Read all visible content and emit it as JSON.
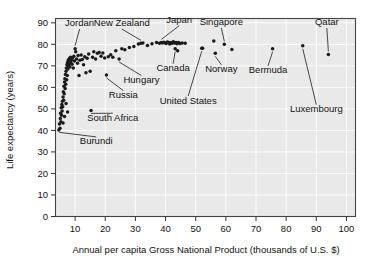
{
  "chart_data": {
    "type": "scatter",
    "title": "",
    "xlabel": "Annual per capita Gross National Product (thousands of U.S. $)",
    "ylabel": "Life expectancy (years)",
    "xlim": [
      3.5,
      103
    ],
    "ylim": [
      0,
      92
    ],
    "xticks": [
      10,
      20,
      30,
      40,
      50,
      60,
      70,
      80,
      90,
      100
    ],
    "xtick_labels": [
      "10",
      "20",
      "30",
      "40",
      "50",
      "60",
      "70",
      "80",
      "90",
      "100"
    ],
    "yticks": [
      0,
      10,
      20,
      30,
      40,
      50,
      60,
      70,
      80,
      90
    ],
    "ytick_labels": [
      "0",
      "10",
      "20",
      "30",
      "40",
      "50",
      "60",
      "70",
      "80",
      "90"
    ],
    "grid": true,
    "legend": "none",
    "marker": "filled-circle",
    "marker_color": "#1a1a1a",
    "plot_background": "#e9e9e9",
    "points": [
      [
        4.6,
        40.2
      ],
      [
        4.8,
        43.0
      ],
      [
        5.0,
        41.0
      ],
      [
        5.1,
        45.5
      ],
      [
        5.2,
        48.0
      ],
      [
        5.3,
        44.0
      ],
      [
        5.4,
        50.5
      ],
      [
        5.5,
        47.0
      ],
      [
        5.6,
        52.0
      ],
      [
        5.7,
        49.0
      ],
      [
        5.8,
        53.5
      ],
      [
        5.9,
        51.0
      ],
      [
        6.0,
        55.5
      ],
      [
        6.0,
        43.5
      ],
      [
        6.1,
        58.0
      ],
      [
        6.2,
        54.0
      ],
      [
        6.3,
        60.5
      ],
      [
        6.4,
        57.0
      ],
      [
        6.5,
        62.5
      ],
      [
        6.5,
        46.5
      ],
      [
        6.6,
        64.0
      ],
      [
        6.7,
        59.5
      ],
      [
        6.8,
        66.0
      ],
      [
        6.9,
        61.5
      ],
      [
        7.0,
        67.5
      ],
      [
        7.0,
        52.5
      ],
      [
        7.1,
        69.0
      ],
      [
        7.2,
        63.5
      ],
      [
        7.3,
        70.5
      ],
      [
        7.4,
        65.5
      ],
      [
        7.5,
        71.5
      ],
      [
        7.5,
        48.5
      ],
      [
        7.6,
        68.5
      ],
      [
        7.7,
        72.5
      ],
      [
        7.8,
        70.0
      ],
      [
        7.9,
        73.0
      ],
      [
        8.0,
        71.0
      ],
      [
        8.1,
        72.0
      ],
      [
        8.2,
        73.5
      ],
      [
        8.3,
        69.5
      ],
      [
        8.5,
        74.0
      ],
      [
        8.6,
        71.8
      ],
      [
        8.8,
        72.8
      ],
      [
        9.0,
        70.8
      ],
      [
        9.2,
        73.8
      ],
      [
        9.4,
        69.0
      ],
      [
        9.6,
        74.5
      ],
      [
        9.8,
        72.2
      ],
      [
        10.0,
        78.0
      ],
      [
        10.2,
        76.5
      ],
      [
        10.5,
        73.2
      ],
      [
        10.8,
        71.2
      ],
      [
        11.0,
        74.8
      ],
      [
        11.3,
        65.5
      ],
      [
        11.6,
        72.6
      ],
      [
        12.0,
        75.0
      ],
      [
        12.4,
        73.0
      ],
      [
        12.8,
        70.5
      ],
      [
        13.2,
        74.2
      ],
      [
        13.6,
        66.8
      ],
      [
        14.0,
        73.5
      ],
      [
        14.5,
        75.5
      ],
      [
        15.0,
        67.5
      ],
      [
        15.3,
        49.3
      ],
      [
        15.8,
        74.0
      ],
      [
        16.2,
        76.5
      ],
      [
        16.8,
        73.2
      ],
      [
        17.4,
        75.8
      ],
      [
        18.0,
        76.2
      ],
      [
        18.6,
        74.5
      ],
      [
        19.2,
        76.0
      ],
      [
        19.8,
        73.6
      ],
      [
        20.4,
        65.8
      ],
      [
        21.0,
        74.2
      ],
      [
        21.8,
        75.2
      ],
      [
        22.5,
        74.0
      ],
      [
        23.5,
        77.0
      ],
      [
        24.6,
        73.2
      ],
      [
        25.5,
        78.0
      ],
      [
        26.5,
        77.5
      ],
      [
        28.0,
        78.5
      ],
      [
        29.5,
        79.0
      ],
      [
        31.0,
        80.2
      ],
      [
        31.8,
        80.5
      ],
      [
        32.5,
        80.6
      ],
      [
        34.0,
        79.5
      ],
      [
        35.5,
        80.3
      ],
      [
        37.0,
        80.8
      ],
      [
        38.0,
        80.5
      ],
      [
        38.6,
        80.9
      ],
      [
        39.0,
        80.6
      ],
      [
        39.4,
        81.0
      ],
      [
        39.8,
        80.7
      ],
      [
        40.2,
        80.4
      ],
      [
        40.6,
        81.1
      ],
      [
        41.0,
        80.8
      ],
      [
        41.4,
        80.2
      ],
      [
        41.8,
        80.9
      ],
      [
        42.2,
        80.5
      ],
      [
        42.6,
        81.2
      ],
      [
        43.0,
        80.6
      ],
      [
        43.2,
        78.0
      ],
      [
        43.5,
        80.9
      ],
      [
        43.8,
        80.3
      ],
      [
        44.0,
        77.0
      ],
      [
        44.3,
        80.8
      ],
      [
        44.8,
        80.4
      ],
      [
        45.5,
        80.6
      ],
      [
        46.5,
        80.5
      ],
      [
        52.0,
        78.2
      ],
      [
        52.3,
        78.2
      ],
      [
        56.0,
        81.5
      ],
      [
        56.5,
        75.8
      ],
      [
        59.5,
        80.0
      ],
      [
        62.0,
        77.6
      ],
      [
        75.5,
        78.0
      ],
      [
        85.5,
        79.3
      ],
      [
        94.0,
        75.3
      ]
    ],
    "annotations": [
      {
        "label": "Jordan",
        "label_x": 11.5,
        "label_y": 88.5,
        "point_x": 10.0,
        "point_y": 78.0
      },
      {
        "label": "New Zealand",
        "label_x": 25.5,
        "label_y": 88.5,
        "point_x": 31.8,
        "point_y": 80.5
      },
      {
        "label": "Japan",
        "label_x": 44.5,
        "label_y": 90.0,
        "point_x": 38.6,
        "point_y": 80.9
      },
      {
        "label": "Singapore",
        "label_x": 58.5,
        "label_y": 89.0,
        "point_x": 59.5,
        "point_y": 80.0
      },
      {
        "label": "Qatar",
        "label_x": 93.5,
        "label_y": 89.0,
        "point_x": 94.0,
        "point_y": 75.3
      },
      {
        "label": "Canada",
        "label_x": 42.5,
        "label_y": 67.5,
        "point_x": 43.2,
        "point_y": 78.0
      },
      {
        "label": "Norway",
        "label_x": 58.5,
        "label_y": 67.0,
        "point_x": 56.5,
        "point_y": 75.8
      },
      {
        "label": "Bermuda",
        "label_x": 74.0,
        "label_y": 66.5,
        "point_x": 75.5,
        "point_y": 78.0
      },
      {
        "label": "Hungary",
        "label_x": 32.0,
        "label_y": 62.0,
        "point_x": 24.6,
        "point_y": 73.2
      },
      {
        "label": "Russia",
        "label_x": 26.0,
        "label_y": 55.0,
        "point_x": 20.4,
        "point_y": 65.8
      },
      {
        "label": "United States",
        "label_x": 47.5,
        "label_y": 52.5,
        "point_x": 52.0,
        "point_y": 78.2
      },
      {
        "label": "Luxembourg",
        "label_x": 90.0,
        "label_y": 48.5,
        "point_x": 85.5,
        "point_y": 79.3
      },
      {
        "label": "South Africa",
        "label_x": 22.5,
        "label_y": 44.5,
        "point_x": 15.3,
        "point_y": 49.3
      },
      {
        "label": "Burundi",
        "label_x": 17.0,
        "label_y": 33.5,
        "point_x": 4.7,
        "point_y": 40.5
      }
    ]
  }
}
